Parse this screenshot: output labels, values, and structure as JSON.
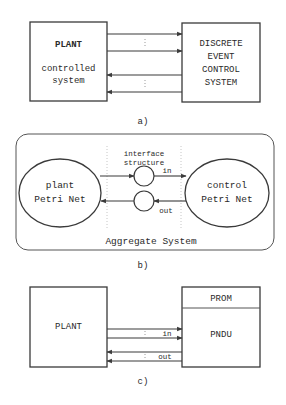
{
  "diagram_a": {
    "plant_box": {
      "title": "PLANT",
      "subtitle_line1": "controlled",
      "subtitle_line2": "system"
    },
    "des_box": {
      "line1": "DISCRETE",
      "line2": "EVENT",
      "line3": "CONTROL",
      "line4": "SYSTEM"
    },
    "caption": "a)"
  },
  "diagram_b": {
    "plant_net": {
      "line1": "plant",
      "line2": "Petri Net"
    },
    "control_net": {
      "line1": "control",
      "line2": "Petri Net"
    },
    "interface_label_line1": "interface",
    "interface_label_line2": "structure",
    "in_label": "in",
    "out_label": "out",
    "container_label": "Aggregate System",
    "caption": "b)"
  },
  "diagram_c": {
    "plant_box": {
      "title": "PLANT"
    },
    "controller_box": {
      "top_label": "PROM",
      "bottom_label": "PNDU"
    },
    "in_label": "in",
    "out_label": "out",
    "caption": "c)"
  }
}
